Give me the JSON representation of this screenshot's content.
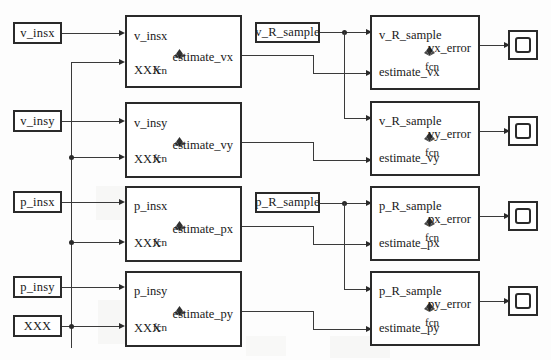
{
  "diagram": {
    "colors": {
      "line": "#3a3a3a",
      "block_border": "#2a2a2a",
      "block_fill": "#ffffff",
      "canvas": "#fdfdfd"
    }
  },
  "sources": [
    {
      "label": "v_insx"
    },
    {
      "label": "v_insy"
    },
    {
      "label": "p_insx"
    },
    {
      "label": "p_insy"
    },
    {
      "label": "XXX"
    }
  ],
  "sample_blocks": [
    {
      "label": "v_R_sample"
    },
    {
      "label": "p_R_sample"
    }
  ],
  "estimator_blocks": [
    {
      "in1": "v_insx",
      "in2": "XXX",
      "out": "estimate_vx",
      "fcn": "fcn",
      "icon": "matlab-membrane-icon"
    },
    {
      "in1": "v_insy",
      "in2": "XXX",
      "out": "estimate_vy",
      "fcn": "fcn",
      "icon": "matlab-membrane-icon"
    },
    {
      "in1": "p_insx",
      "in2": "XXX",
      "out": "estimate_px",
      "fcn": "fcn",
      "icon": "matlab-membrane-icon"
    },
    {
      "in1": "p_insy",
      "in2": "XXX",
      "out": "estimate_py",
      "fcn": "fcn",
      "icon": "matlab-membrane-icon"
    }
  ],
  "error_blocks": [
    {
      "in1": "v_R_sample",
      "in2": "estimate_vx",
      "out": "vx_error",
      "fcn": "fcn",
      "icon": "matlab-membrane-icon"
    },
    {
      "in1": "v_R_sample",
      "in2": "estimate_vy",
      "out": "vy_error",
      "fcn": "fcn",
      "icon": "matlab-membrane-icon"
    },
    {
      "in1": "p_R_sample",
      "in2": "estimate_px",
      "out": "px_error",
      "fcn": "fcn",
      "icon": "matlab-membrane-icon"
    },
    {
      "in1": "p_R_sample",
      "in2": "estimate_py",
      "out": "py_error",
      "fcn": "fcn",
      "icon": "matlab-membrane-icon"
    }
  ],
  "scopes": [
    {
      "name": "scope-vx"
    },
    {
      "name": "scope-vy"
    },
    {
      "name": "scope-px"
    },
    {
      "name": "scope-py"
    }
  ]
}
